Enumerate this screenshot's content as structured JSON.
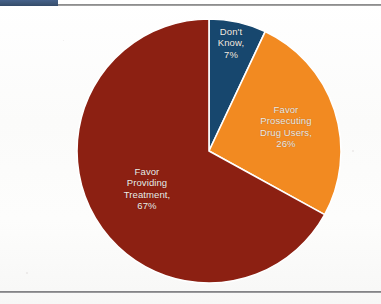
{
  "page": {
    "width": 381,
    "height": 304,
    "background_color": "#fdfdfc",
    "top_rule_color": "#7f7f80",
    "top_accent_color": "#3d5676",
    "bottom_rule_color": "#75757a"
  },
  "chart_data": {
    "type": "pie",
    "title": "",
    "subtitle": "",
    "xlabel": "",
    "ylabel": "",
    "legend_position": "none",
    "grid": false,
    "label_style": "inside-slice",
    "start_angle_deg": 0,
    "direction": "clockwise",
    "center": {
      "x": 209,
      "y": 143
    },
    "radius": 132,
    "categories": [
      "Don't Know",
      "Favor Prosecuting Drug Users",
      "Favor Providing Treatment"
    ],
    "values": [
      7,
      26,
      67
    ],
    "value_unit": "%",
    "colors": [
      "#17476e",
      "#f28a21",
      "#8c2012"
    ],
    "slices": [
      {
        "name": "dont-know",
        "label": "Don't\nKnow,\n7%",
        "category": "Don't Know",
        "value": 7,
        "value_text": "7%",
        "color": "#17476e",
        "start_deg": 0,
        "end_deg": 25.2
      },
      {
        "name": "favor-prosecuting-drug-users",
        "label": "Favor\nProsecuting\nDrug Users,\n26%",
        "category": "Favor Prosecuting Drug Users",
        "value": 26,
        "value_text": "26%",
        "color": "#f28a21",
        "start_deg": 25.2,
        "end_deg": 118.8
      },
      {
        "name": "favor-providing-treatment",
        "label": "Favor\nProviding\nTreatment,\n67%",
        "category": "Favor Providing Treatment",
        "value": 67,
        "value_text": "67%",
        "color": "#8c2012",
        "start_deg": 118.8,
        "end_deg": 360
      }
    ],
    "slice_separator_color": "#ffffff",
    "label_text_color": "#f2ece6"
  }
}
